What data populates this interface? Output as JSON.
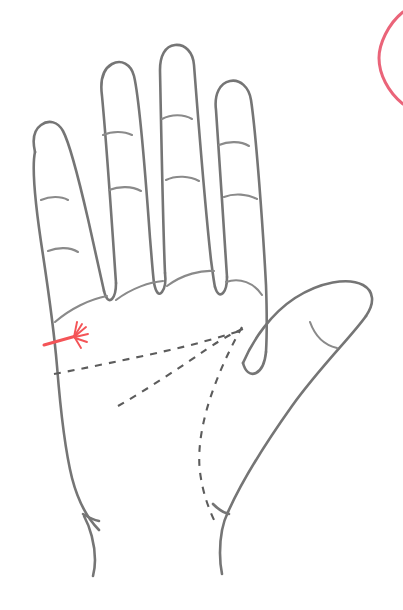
{
  "canvas": {
    "width": 403,
    "height": 610,
    "background": "#ffffff",
    "title": "Palm anatomy line drawing with annotation"
  },
  "colors": {
    "outline": "#757575",
    "crease": "#8a8a8a",
    "dashed_line": "#5c5c5c",
    "marker_red": "#f45457",
    "arc_pink": "#e8576e"
  },
  "illustration": {
    "subject": "open left palm, fingers spread, thumb to the right",
    "style": "hand-drawn monochrome line art",
    "hand_outline_label": "hand-outline",
    "wrist_label": "wrist"
  },
  "fingers": [
    {
      "name": "pinky-finger",
      "crease_count": 2
    },
    {
      "name": "ring-finger",
      "crease_count": 2
    },
    {
      "name": "middle-finger",
      "crease_count": 2
    },
    {
      "name": "index-finger",
      "crease_count": 2
    },
    {
      "name": "thumb",
      "crease_count": 1
    }
  ],
  "palm_lines": [
    {
      "name": "heart-line",
      "style": "dashed"
    },
    {
      "name": "head-line",
      "style": "dashed"
    },
    {
      "name": "life-line",
      "style": "dashed"
    }
  ],
  "annotations": [
    {
      "name": "red-pointer-marker",
      "style": "red line with splayed starburst tip",
      "color": "#f45457",
      "points_to": "ulnar edge of palm below the pinky"
    },
    {
      "name": "pink-arc-marker",
      "style": "partial pink ellipse, cropped at top-right corner",
      "color": "#e8576e"
    }
  ]
}
